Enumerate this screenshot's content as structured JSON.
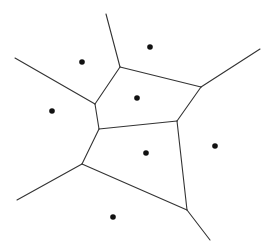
{
  "diagram": {
    "type": "voronoi",
    "background": "#ffffff",
    "edge_color": "#333333",
    "site_color": "#111111",
    "site_radius": 2.8,
    "sites": [
      {
        "x": 82,
        "y": 62
      },
      {
        "x": 150,
        "y": 47
      },
      {
        "x": 52,
        "y": 111
      },
      {
        "x": 137,
        "y": 98
      },
      {
        "x": 146,
        "y": 153
      },
      {
        "x": 215,
        "y": 146
      },
      {
        "x": 113,
        "y": 217
      }
    ],
    "vertices": {
      "A": {
        "x": 120,
        "y": 67
      },
      "B": {
        "x": 95,
        "y": 104
      },
      "C": {
        "x": 201,
        "y": 87
      },
      "D": {
        "x": 177,
        "y": 121
      },
      "E": {
        "x": 99,
        "y": 129
      },
      "F": {
        "x": 82,
        "y": 164
      },
      "G": {
        "x": 187,
        "y": 210
      }
    },
    "edges": [
      {
        "x1": 106,
        "y1": 14,
        "x2": 120,
        "y2": 67
      },
      {
        "x1": 15,
        "y1": 58,
        "x2": 95,
        "y2": 104
      },
      {
        "x1": 120,
        "y1": 67,
        "x2": 95,
        "y2": 104
      },
      {
        "x1": 120,
        "y1": 67,
        "x2": 201,
        "y2": 87
      },
      {
        "x1": 201,
        "y1": 87,
        "x2": 260,
        "y2": 49
      },
      {
        "x1": 201,
        "y1": 87,
        "x2": 177,
        "y2": 121
      },
      {
        "x1": 95,
        "y1": 104,
        "x2": 99,
        "y2": 129
      },
      {
        "x1": 99,
        "y1": 129,
        "x2": 177,
        "y2": 121
      },
      {
        "x1": 99,
        "y1": 129,
        "x2": 82,
        "y2": 164
      },
      {
        "x1": 82,
        "y1": 164,
        "x2": 17,
        "y2": 200
      },
      {
        "x1": 82,
        "y1": 164,
        "x2": 187,
        "y2": 210
      },
      {
        "x1": 177,
        "y1": 121,
        "x2": 187,
        "y2": 210
      },
      {
        "x1": 187,
        "y1": 210,
        "x2": 210,
        "y2": 240
      }
    ]
  }
}
